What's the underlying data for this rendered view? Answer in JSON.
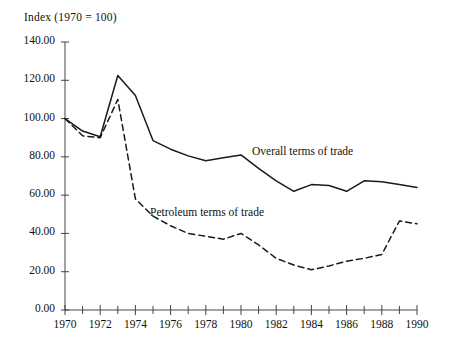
{
  "chart_data": {
    "type": "line",
    "title": "Index (1970 = 100)",
    "xlabel": "",
    "ylabel": "",
    "xlim": [
      1970,
      1990
    ],
    "ylim": [
      0,
      140
    ],
    "grid": false,
    "legend_position": "inline-annotations",
    "yticks": [
      "0.00",
      "20.00",
      "40.00",
      "60.00",
      "80.00",
      "100.00",
      "120.00",
      "140.00"
    ],
    "ytick_values": [
      0,
      20,
      40,
      60,
      80,
      100,
      120,
      140
    ],
    "xticks": [
      "1970",
      "1972",
      "1974",
      "1976",
      "1978",
      "1980",
      "1982",
      "1984",
      "1986",
      "1988",
      "1990"
    ],
    "xtick_values": [
      1970,
      1972,
      1974,
      1976,
      1978,
      1980,
      1982,
      1984,
      1986,
      1988,
      1990
    ],
    "minor_xticks": [
      1971,
      1973,
      1975,
      1977,
      1979,
      1981,
      1983,
      1985,
      1987,
      1989
    ],
    "x": [
      1970,
      1971,
      1972,
      1973,
      1974,
      1975,
      1976,
      1977,
      1978,
      1979,
      1980,
      1981,
      1982,
      1983,
      1984,
      1985,
      1986,
      1987,
      1988,
      1989,
      1990
    ],
    "series": [
      {
        "name": "Overall terms of trade",
        "style": "solid",
        "color": "#1a1a1a",
        "values": [
          100.0,
          93.5,
          90.5,
          122.5,
          112.0,
          88.5,
          84.0,
          80.5,
          78.0,
          79.5,
          81.0,
          74.0,
          67.5,
          62.0,
          65.5,
          65.0,
          62.0,
          67.5,
          67.0,
          65.5,
          64.0
        ]
      },
      {
        "name": "Petroleum terms of trade",
        "style": "dashed",
        "color": "#1a1a1a",
        "values": [
          100.0,
          91.0,
          90.0,
          110.0,
          58.0,
          49.0,
          44.0,
          40.0,
          38.5,
          37.0,
          40.0,
          34.0,
          27.0,
          23.5,
          21.0,
          23.0,
          25.5,
          27.0,
          29.0,
          46.5,
          45.0
        ]
      }
    ],
    "annotations": [
      {
        "text": "Overall terms of trade",
        "x": 1982.0,
        "y": 86.0
      },
      {
        "text": "Petroleum terms of trade",
        "x": 1975.0,
        "y": 54.0
      }
    ]
  },
  "axes": {
    "y_axis_top_value": 140,
    "y_axis_bottom_value": 0,
    "x_axis_left_value": 1970,
    "x_axis_right_value": 1990
  }
}
